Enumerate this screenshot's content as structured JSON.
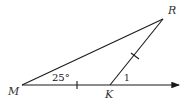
{
  "diagram": {
    "type": "geometry-triangle",
    "points": {
      "M": {
        "label": "M"
      },
      "K": {
        "label": "K"
      },
      "R": {
        "label": "R"
      }
    },
    "angle_at_M": "25°",
    "angle_1_label": "1",
    "congruent_marks": [
      "MK",
      "KR"
    ],
    "ray": "M→K extended with arrow",
    "colors": {
      "stroke": "#1a1a1a",
      "label": "#333333"
    }
  }
}
